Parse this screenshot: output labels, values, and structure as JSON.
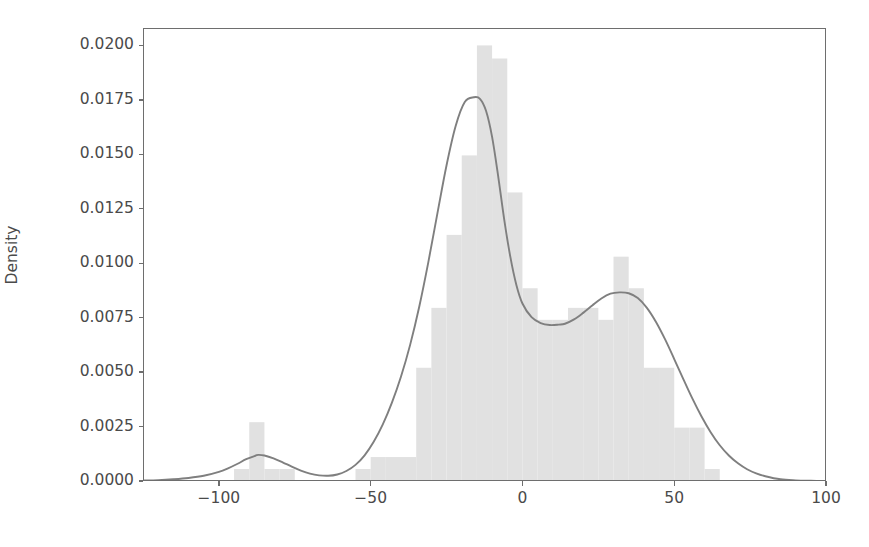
{
  "chart_data": {
    "type": "histogram",
    "title": "",
    "xlabel": "",
    "ylabel": "Density",
    "xlim": [
      -125,
      100
    ],
    "ylim": [
      0,
      0.0208
    ],
    "xticks": [
      -100,
      -50,
      0,
      50,
      100
    ],
    "xtick_labels": [
      "−100",
      "−50",
      "0",
      "50",
      "100"
    ],
    "yticks": [
      0.0,
      0.0025,
      0.005,
      0.0075,
      0.01,
      0.0125,
      0.015,
      0.0175,
      0.02
    ],
    "ytick_labels": [
      "0.0000",
      "0.0025",
      "0.0050",
      "0.0075",
      "0.0100",
      "0.0125",
      "0.0150",
      "0.0175",
      "0.0200"
    ],
    "grid": false,
    "legend": null,
    "bar_color": "#e1e1e1",
    "kde_color": "#7f7f7f",
    "axis_color": "#6e6e6e",
    "text_color": "#4a4a4a",
    "bin_width": 5,
    "bins": [
      {
        "x0": -125,
        "x1": -120,
        "density": 0.0
      },
      {
        "x0": -120,
        "x1": -115,
        "density": 0.0
      },
      {
        "x0": -115,
        "x1": -110,
        "density": 0.0
      },
      {
        "x0": -110,
        "x1": -105,
        "density": 0.0
      },
      {
        "x0": -105,
        "x1": -100,
        "density": 0.0
      },
      {
        "x0": -100,
        "x1": -95,
        "density": 0.0
      },
      {
        "x0": -95,
        "x1": -90,
        "density": 0.00055
      },
      {
        "x0": -90,
        "x1": -85,
        "density": 0.0027
      },
      {
        "x0": -85,
        "x1": -80,
        "density": 0.00055
      },
      {
        "x0": -80,
        "x1": -75,
        "density": 0.00055
      },
      {
        "x0": -75,
        "x1": -70,
        "density": 0.0
      },
      {
        "x0": -70,
        "x1": -65,
        "density": 0.0
      },
      {
        "x0": -65,
        "x1": -60,
        "density": 0.0
      },
      {
        "x0": -60,
        "x1": -55,
        "density": 0.0
      },
      {
        "x0": -55,
        "x1": -50,
        "density": 0.00055
      },
      {
        "x0": -50,
        "x1": -45,
        "density": 0.0011
      },
      {
        "x0": -45,
        "x1": -40,
        "density": 0.0011
      },
      {
        "x0": -40,
        "x1": -35,
        "density": 0.0011
      },
      {
        "x0": -35,
        "x1": -30,
        "density": 0.0052
      },
      {
        "x0": -30,
        "x1": -25,
        "density": 0.00795
      },
      {
        "x0": -25,
        "x1": -20,
        "density": 0.0113
      },
      {
        "x0": -20,
        "x1": -15,
        "density": 0.01495
      },
      {
        "x0": -15,
        "x1": -10,
        "density": 0.02
      },
      {
        "x0": -10,
        "x1": -5,
        "density": 0.0194
      },
      {
        "x0": -5,
        "x1": 0,
        "density": 0.01325
      },
      {
        "x0": 0,
        "x1": 5,
        "density": 0.00885
      },
      {
        "x0": 5,
        "x1": 10,
        "density": 0.0074
      },
      {
        "x0": 10,
        "x1": 15,
        "density": 0.0074
      },
      {
        "x0": 15,
        "x1": 20,
        "density": 0.00795
      },
      {
        "x0": 20,
        "x1": 25,
        "density": 0.00795
      },
      {
        "x0": 25,
        "x1": 30,
        "density": 0.0074
      },
      {
        "x0": 30,
        "x1": 35,
        "density": 0.0103
      },
      {
        "x0": 35,
        "x1": 40,
        "density": 0.00885
      },
      {
        "x0": 40,
        "x1": 45,
        "density": 0.0052
      },
      {
        "x0": 45,
        "x1": 50,
        "density": 0.0052
      },
      {
        "x0": 50,
        "x1": 55,
        "density": 0.00245
      },
      {
        "x0": 55,
        "x1": 60,
        "density": 0.00245
      },
      {
        "x0": 60,
        "x1": 65,
        "density": 0.00055
      },
      {
        "x0": 65,
        "x1": 70,
        "density": 0.0
      },
      {
        "x0": 70,
        "x1": 75,
        "density": 0.0
      },
      {
        "x0": 75,
        "x1": 80,
        "density": 0.0
      },
      {
        "x0": 80,
        "x1": 85,
        "density": 0.0
      },
      {
        "x0": 85,
        "x1": 90,
        "density": 0.0
      },
      {
        "x0": 90,
        "x1": 95,
        "density": 0.0
      },
      {
        "x0": 95,
        "x1": 100,
        "density": 0.0
      }
    ],
    "kde": {
      "name": "density-estimate",
      "x": [
        -125,
        -120,
        -115,
        -110,
        -105,
        -100,
        -97,
        -94,
        -91,
        -88,
        -87,
        -85,
        -82,
        -79,
        -76,
        -73,
        -70,
        -67,
        -64,
        -61,
        -58,
        -55,
        -52,
        -49,
        -46,
        -43,
        -40,
        -37,
        -34,
        -31,
        -28,
        -25,
        -22,
        -19,
        -16,
        -14,
        -12,
        -10,
        -8,
        -6,
        -4,
        -2,
        0,
        3,
        6,
        9,
        12,
        14,
        17,
        20,
        23,
        26,
        29,
        32,
        35,
        38,
        41,
        44,
        47,
        50,
        53,
        56,
        59,
        62,
        65,
        68,
        71,
        74,
        77,
        80,
        85,
        90,
        95,
        100
      ],
      "y": [
        2e-05,
        4e-05,
        8e-05,
        0.00014,
        0.00024,
        0.00042,
        0.00058,
        0.00078,
        0.001,
        0.00116,
        0.0012,
        0.00117,
        0.00104,
        0.00086,
        0.00066,
        0.00048,
        0.00034,
        0.00026,
        0.00024,
        0.0003,
        0.00046,
        0.00074,
        0.00118,
        0.0018,
        0.0026,
        0.0036,
        0.0048,
        0.00625,
        0.008,
        0.01005,
        0.0123,
        0.0145,
        0.0163,
        0.0174,
        0.01762,
        0.01755,
        0.017,
        0.0158,
        0.014,
        0.012,
        0.0103,
        0.009,
        0.00815,
        0.00752,
        0.00725,
        0.00716,
        0.00718,
        0.00722,
        0.00742,
        0.00772,
        0.00806,
        0.00838,
        0.0086,
        0.00866,
        0.00862,
        0.0084,
        0.00795,
        0.0073,
        0.0065,
        0.0056,
        0.00468,
        0.00378,
        0.00296,
        0.00224,
        0.00164,
        0.00117,
        0.00081,
        0.00054,
        0.00035,
        0.00022,
        8e-05,
        3e-05,
        1e-05,
        0.0
      ]
    }
  }
}
